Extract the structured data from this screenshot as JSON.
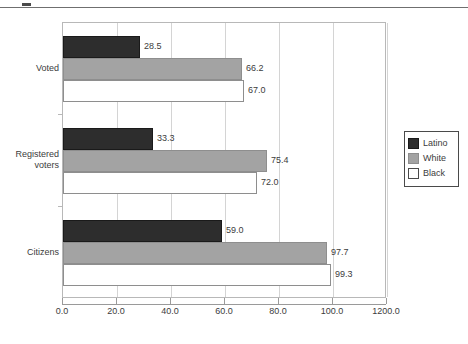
{
  "chart_data": {
    "type": "bar",
    "orientation": "horizontal",
    "title": "",
    "xlabel": "",
    "ylabel": "",
    "categories": [
      "Voted",
      "Registered voters",
      "Citizens"
    ],
    "category_label_lines": [
      [
        "Voted"
      ],
      [
        "Registered",
        "voters"
      ],
      [
        "Citizens"
      ]
    ],
    "series": [
      {
        "name": "Latino",
        "color": "#2d2d2d",
        "values": [
          28.5,
          33.3,
          59.0
        ]
      },
      {
        "name": "White",
        "color": "#a3a3a3",
        "values": [
          66.2,
          75.4,
          97.7
        ]
      },
      {
        "name": "Black",
        "color": "#ffffff",
        "values": [
          67.0,
          72.0,
          99.3
        ]
      }
    ],
    "data_labels": [
      [
        "28.5",
        "66.2",
        "67.0"
      ],
      [
        "33.3",
        "75.4",
        "72.0"
      ],
      [
        "59.0",
        "97.7",
        "99.3"
      ]
    ],
    "xlim": [
      0.0,
      120.0
    ],
    "xticks": [
      0.0,
      20.0,
      40.0,
      60.0,
      80.0,
      100.0,
      120.0
    ],
    "xtick_labels": [
      "0.0",
      "20.0",
      "40.0",
      "60.0",
      "80.0",
      "100.0",
      "1200.0"
    ],
    "grid": true,
    "grid_axis": "x",
    "legend_position": "right",
    "legend_entries": [
      "Latino",
      "White",
      "Black"
    ]
  }
}
